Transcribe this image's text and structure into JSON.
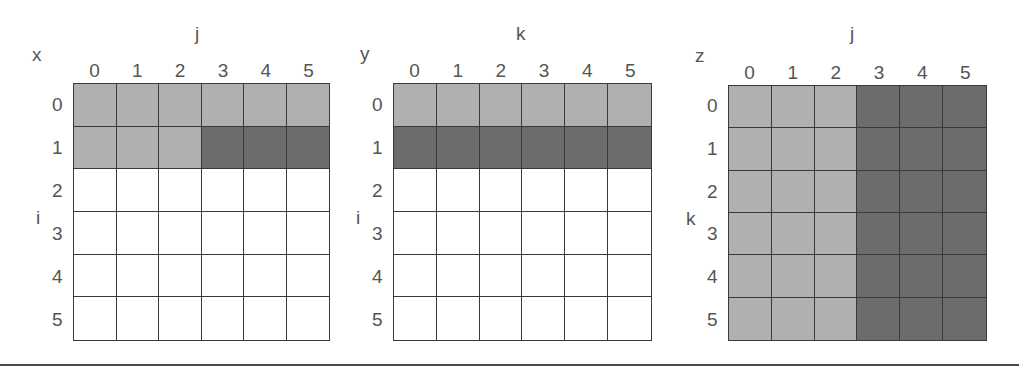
{
  "colors": {
    "light": "#b0b0b0",
    "dark": "#6c6c6c",
    "empty": "#ffffff",
    "grid_line": "#3a3a3a"
  },
  "panels": [
    {
      "name": "x",
      "matrix_label": "x",
      "col_axis": "j",
      "row_axis": "i",
      "col_labels": [
        "0",
        "1",
        "2",
        "3",
        "4",
        "5"
      ],
      "row_labels": [
        "0",
        "1",
        "2",
        "3",
        "4",
        "5"
      ],
      "cells": [
        [
          "L",
          "L",
          "L",
          "L",
          "L",
          "L"
        ],
        [
          "L",
          "L",
          "L",
          "D",
          "D",
          "D"
        ],
        [
          "E",
          "E",
          "E",
          "E",
          "E",
          "E"
        ],
        [
          "E",
          "E",
          "E",
          "E",
          "E",
          "E"
        ],
        [
          "E",
          "E",
          "E",
          "E",
          "E",
          "E"
        ],
        [
          "E",
          "E",
          "E",
          "E",
          "E",
          "E"
        ]
      ],
      "layout": {
        "grid_left": 73,
        "grid_top": 83,
        "grid_w": 257,
        "grid_h": 258,
        "mat_x": 32,
        "mat_y": 45,
        "col_axis_x": 195,
        "row_axis_x": 36,
        "row_lbl_x": 52
      }
    },
    {
      "name": "y",
      "matrix_label": "y",
      "col_axis": "k",
      "row_axis": "i",
      "col_labels": [
        "0",
        "1",
        "2",
        "3",
        "4",
        "5"
      ],
      "row_labels": [
        "0",
        "1",
        "2",
        "3",
        "4",
        "5"
      ],
      "cells": [
        [
          "L",
          "L",
          "L",
          "L",
          "L",
          "L"
        ],
        [
          "D",
          "D",
          "D",
          "D",
          "D",
          "D"
        ],
        [
          "E",
          "E",
          "E",
          "E",
          "E",
          "E"
        ],
        [
          "E",
          "E",
          "E",
          "E",
          "E",
          "E"
        ],
        [
          "E",
          "E",
          "E",
          "E",
          "E",
          "E"
        ],
        [
          "E",
          "E",
          "E",
          "E",
          "E",
          "E"
        ]
      ],
      "layout": {
        "grid_left": 393,
        "grid_top": 83,
        "grid_w": 259,
        "grid_h": 258,
        "mat_x": 360,
        "mat_y": 44,
        "col_axis_x": 516,
        "row_axis_x": 356,
        "row_lbl_x": 372
      }
    },
    {
      "name": "z",
      "matrix_label": "z",
      "col_axis": "j",
      "row_axis": "k",
      "col_labels": [
        "0",
        "1",
        "2",
        "3",
        "4",
        "5"
      ],
      "row_labels": [
        "0",
        "1",
        "2",
        "3",
        "4",
        "5"
      ],
      "cells": [
        [
          "L",
          "L",
          "L",
          "D",
          "D",
          "D"
        ],
        [
          "L",
          "L",
          "L",
          "D",
          "D",
          "D"
        ],
        [
          "L",
          "L",
          "L",
          "D",
          "D",
          "D"
        ],
        [
          "L",
          "L",
          "L",
          "D",
          "D",
          "D"
        ],
        [
          "L",
          "L",
          "L",
          "D",
          "D",
          "D"
        ],
        [
          "L",
          "L",
          "L",
          "D",
          "D",
          "D"
        ]
      ],
      "layout": {
        "grid_left": 728,
        "grid_top": 85,
        "grid_w": 259,
        "grid_h": 256,
        "mat_x": 695,
        "mat_y": 46,
        "col_axis_x": 850,
        "row_axis_x": 686,
        "row_lbl_x": 707
      }
    }
  ]
}
